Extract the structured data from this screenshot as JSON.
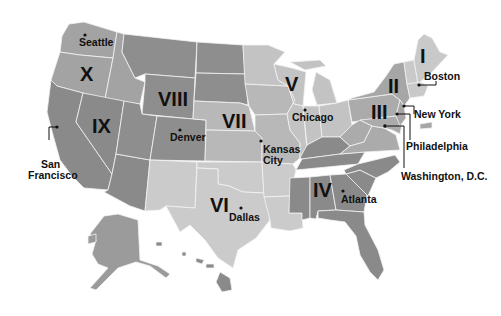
{
  "map": {
    "title": "Federal Regions of the United States",
    "colors": {
      "background": "#ffffff",
      "region_I": "#c9c9c9",
      "region_II": "#a6a6a6",
      "region_III": "#ababab",
      "region_IV": "#8a8a8a",
      "region_V": "#c3c3c3",
      "region_VI": "#cbcbcb",
      "region_VII": "#b8b8b8",
      "region_VIII": "#8e8e8e",
      "region_IX": "#8a8a8a",
      "region_X": "#a3a3a3",
      "border": "#f2f2f2",
      "text": "#111111"
    },
    "regions": [
      {
        "id": "I",
        "label": "I"
      },
      {
        "id": "II",
        "label": "II"
      },
      {
        "id": "III",
        "label": "III"
      },
      {
        "id": "IV",
        "label": "IV"
      },
      {
        "id": "V",
        "label": "V"
      },
      {
        "id": "VI",
        "label": "VI"
      },
      {
        "id": "VII",
        "label": "VII"
      },
      {
        "id": "VIII",
        "label": "VIII"
      },
      {
        "id": "IX",
        "label": "IX"
      },
      {
        "id": "X",
        "label": "X"
      }
    ],
    "cities": [
      {
        "name": "Seattle",
        "region": "X"
      },
      {
        "name": "San",
        "name2": "Francisco",
        "region": "IX"
      },
      {
        "name": "Denver",
        "region": "VIII"
      },
      {
        "name": "Kansas",
        "name2": "City",
        "region": "VII"
      },
      {
        "name": "Dallas",
        "region": "VI"
      },
      {
        "name": "Chicago",
        "region": "V"
      },
      {
        "name": "Atlanta",
        "region": "IV"
      },
      {
        "name": "Philadelphia",
        "region": "III"
      },
      {
        "name": "Washington, D.C.",
        "region": "III"
      },
      {
        "name": "New York",
        "region": "II"
      },
      {
        "name": "Boston",
        "region": "I"
      }
    ]
  }
}
